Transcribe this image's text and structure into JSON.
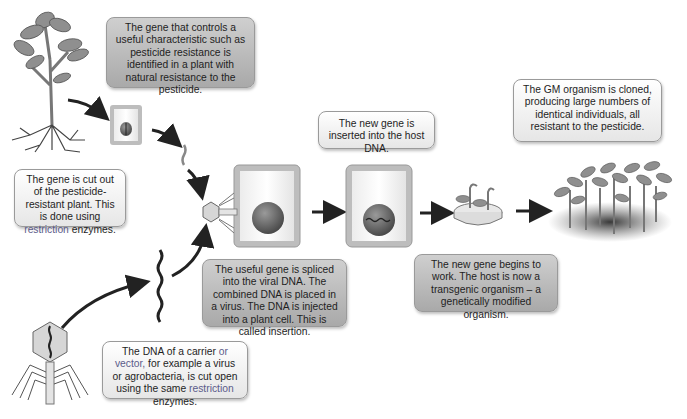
{
  "diagram": {
    "steps": {
      "identify": {
        "text": "The gene that controls a useful characteristic such as pesticide resistance is identified in a plant with natural resistance to the pesticide."
      },
      "cut_out": {
        "before": "The gene is cut out of the pesticide-resistant plant. This is done using ",
        "highlight": "restriction",
        "after": " enzymes."
      },
      "vector": {
        "part1": "The DNA of a carrier ",
        "highlight1": "or vector,",
        "part2": " for example a virus or agrobacteria, is cut open using the same ",
        "highlight2": "restriction",
        "part3": " enzymes."
      },
      "splice": {
        "text": "The useful gene is spliced into the viral DNA. The combined DNA is placed in a virus. The DNA is injected into a plant cell. This is called insertion."
      },
      "insert": {
        "text": "The new gene is inserted into the host DNA."
      },
      "transgenic": {
        "text": "The new gene begins to work. The host is now a transgenic organism – a genetically modified organism."
      },
      "clone": {
        "text": "The GM organism is cloned, producing large numbers of identical individuals, all resistant to the pesticide."
      }
    },
    "illustrations": [
      "resistant-plant",
      "plant-cell",
      "gene-fragment",
      "virus-vector",
      "vector-dna",
      "virus-injecting-cell",
      "host-cell-with-new-gene",
      "petri-dish-seedlings",
      "cloned-plants"
    ],
    "colors": {
      "highlight": "#5b5b8a",
      "dark_box": "#b8b8b8",
      "light_box": "#f2f2f2",
      "arrow": "#222222"
    }
  }
}
